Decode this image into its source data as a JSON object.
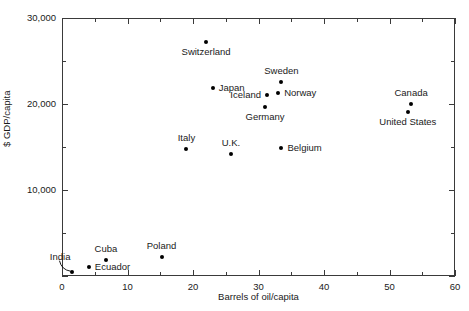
{
  "chart_data": {
    "type": "scatter",
    "title": "",
    "xlabel": "Barrels of oil/capita",
    "ylabel": "$ GDP/capita",
    "xlim": [
      0,
      60
    ],
    "ylim": [
      0,
      30000
    ],
    "xticks": [
      0,
      10,
      20,
      30,
      40,
      50,
      60
    ],
    "xticklabels": [
      "0",
      "10",
      "20",
      "30",
      "40",
      "50",
      "60"
    ],
    "xminorticks": [
      5,
      15,
      25,
      35,
      45,
      55
    ],
    "yticks": [
      0,
      10000,
      20000,
      30000
    ],
    "yticklabels": [
      "",
      "10,000",
      "20,000",
      "30,000"
    ],
    "yminorticks": [
      5000,
      15000,
      25000
    ],
    "grid": false,
    "legend": false,
    "frame": "box",
    "points": [
      {
        "label": "Switzerland",
        "x": 22.0,
        "y": 27200,
        "label_pos": "below"
      },
      {
        "label": "Sweden",
        "x": 33.5,
        "y": 22600,
        "label_pos": "above"
      },
      {
        "label": "Japan",
        "x": 23.0,
        "y": 21900,
        "label_pos": "right"
      },
      {
        "label": "Norway",
        "x": 33.0,
        "y": 21300,
        "label_pos": "right"
      },
      {
        "label": "Iceland",
        "x": 31.3,
        "y": 21000,
        "label_pos": "left"
      },
      {
        "label": "Canada",
        "x": 53.3,
        "y": 20000,
        "label_pos": "above"
      },
      {
        "label": "Germany",
        "x": 31.0,
        "y": 19700,
        "label_pos": "below"
      },
      {
        "label": "United States",
        "x": 52.8,
        "y": 19100,
        "label_pos": "below"
      },
      {
        "label": "Belgium",
        "x": 33.5,
        "y": 14900,
        "label_pos": "right"
      },
      {
        "label": "Italy",
        "x": 19.0,
        "y": 14800,
        "label_pos": "above"
      },
      {
        "label": "U.K.",
        "x": 25.8,
        "y": 14200,
        "label_pos": "above"
      },
      {
        "label": "Poland",
        "x": 15.2,
        "y": 2200,
        "label_pos": "above"
      },
      {
        "label": "Cuba",
        "x": 6.7,
        "y": 1850,
        "label_pos": "above"
      },
      {
        "label": "Ecuador",
        "x": 4.1,
        "y": 1100,
        "label_pos": "right"
      },
      {
        "label": "India",
        "x": 1.6,
        "y": 500,
        "label_pos": "leader"
      }
    ],
    "annotations": [
      {
        "name": "india-leader-line",
        "from_label": "India",
        "to_point": "India"
      }
    ],
    "colors": {
      "marker": "#000000",
      "axis": "#3a3a3a",
      "text": "#1a1a1a",
      "background": "#ffffff"
    }
  }
}
